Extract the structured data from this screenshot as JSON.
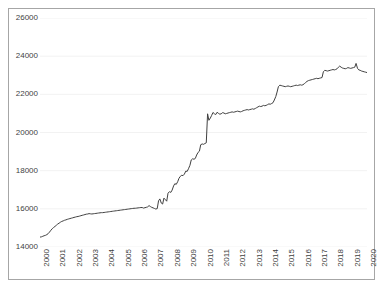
{
  "title_remnant": "",
  "chart_data": {
    "type": "line",
    "title": "",
    "subtitle": "",
    "xlabel": "",
    "ylabel": "",
    "xlim": [
      2000,
      2020
    ],
    "ylim": [
      14000,
      26000
    ],
    "y_ticks": [
      14000,
      16000,
      18000,
      20000,
      22000,
      24000,
      26000
    ],
    "y_tick_labels": [
      "14000",
      "16000",
      "18000",
      "20000",
      "22000",
      "24000",
      "26000"
    ],
    "x_ticks": [
      2000,
      2001,
      2002,
      2003,
      2004,
      2005,
      2006,
      2007,
      2008,
      2009,
      2010,
      2011,
      2012,
      2013,
      2014,
      2015,
      2016,
      2017,
      2018,
      2019,
      2020
    ],
    "x_tick_labels": [
      "2000",
      "2001",
      "2002",
      "2003",
      "2004",
      "2005",
      "2006",
      "2007",
      "2008",
      "2009",
      "2010",
      "2011",
      "2012",
      "2013",
      "2014",
      "2015",
      "2016",
      "2017",
      "2018",
      "2019",
      "2020"
    ],
    "x_tick_rotation": -90,
    "grid": {
      "horizontal": true,
      "vertical": false,
      "color": "#f2f2f2"
    },
    "legend": {
      "visible": false,
      "position": "none"
    },
    "line_color": "#404040",
    "line_width": 1,
    "marker": "none",
    "series": [
      {
        "name": "series-1",
        "x": [
          2000.0,
          2000.08,
          2000.17,
          2000.25,
          2000.33,
          2000.42,
          2000.5,
          2000.58,
          2000.67,
          2000.75,
          2000.83,
          2000.92,
          2001.0,
          2001.08,
          2001.17,
          2001.25,
          2001.33,
          2001.42,
          2001.5,
          2001.58,
          2001.67,
          2001.75,
          2001.83,
          2001.92,
          2002.0,
          2002.08,
          2002.17,
          2002.25,
          2002.33,
          2002.42,
          2002.5,
          2002.58,
          2002.67,
          2002.75,
          2002.83,
          2002.92,
          2003.0,
          2003.08,
          2003.17,
          2003.25,
          2003.33,
          2003.42,
          2003.5,
          2003.58,
          2003.67,
          2003.75,
          2003.83,
          2003.92,
          2004.0,
          2004.08,
          2004.17,
          2004.25,
          2004.33,
          2004.42,
          2004.5,
          2004.58,
          2004.67,
          2004.75,
          2004.83,
          2004.92,
          2005.0,
          2005.08,
          2005.17,
          2005.25,
          2005.33,
          2005.42,
          2005.5,
          2005.58,
          2005.67,
          2005.75,
          2005.83,
          2005.92,
          2006.0,
          2006.08,
          2006.17,
          2006.25,
          2006.33,
          2006.42,
          2006.5,
          2006.58,
          2006.67,
          2006.75,
          2006.83,
          2006.92,
          2007.0,
          2007.08,
          2007.17,
          2007.25,
          2007.33,
          2007.42,
          2007.5,
          2007.58,
          2007.67,
          2007.75,
          2007.83,
          2007.92,
          2008.0,
          2008.08,
          2008.17,
          2008.25,
          2008.33,
          2008.42,
          2008.5,
          2008.58,
          2008.67,
          2008.75,
          2008.83,
          2008.92,
          2009.0,
          2009.08,
          2009.17,
          2009.25,
          2009.33,
          2009.42,
          2009.5,
          2009.58,
          2009.67,
          2009.75,
          2009.83,
          2009.92,
          2010.0,
          2010.08,
          2010.17,
          2010.25,
          2010.33,
          2010.42,
          2010.5,
          2010.58,
          2010.67,
          2010.75,
          2010.83,
          2010.92,
          2011.0,
          2011.08,
          2011.17,
          2011.25,
          2011.33,
          2011.42,
          2011.5,
          2011.58,
          2011.67,
          2011.75,
          2011.83,
          2011.92,
          2012.0,
          2012.08,
          2012.17,
          2012.25,
          2012.33,
          2012.42,
          2012.5,
          2012.58,
          2012.67,
          2012.75,
          2012.83,
          2012.92,
          2013.0,
          2013.08,
          2013.17,
          2013.25,
          2013.33,
          2013.42,
          2013.5,
          2013.58,
          2013.67,
          2013.75,
          2013.83,
          2013.92,
          2014.0,
          2014.08,
          2014.17,
          2014.25,
          2014.33,
          2014.42,
          2014.5,
          2014.58,
          2014.67,
          2014.75,
          2014.83,
          2014.92,
          2015.0,
          2015.08,
          2015.17,
          2015.25,
          2015.33,
          2015.42,
          2015.5,
          2015.58,
          2015.67,
          2015.75,
          2015.83,
          2015.92,
          2016.0,
          2016.08,
          2016.17,
          2016.25,
          2016.33,
          2016.42,
          2016.5,
          2016.58,
          2016.67,
          2016.75,
          2016.83,
          2016.92,
          2017.0,
          2017.08,
          2017.17,
          2017.25,
          2017.33,
          2017.42,
          2017.5,
          2017.58,
          2017.67,
          2017.75,
          2017.83,
          2017.92,
          2018.0,
          2018.08,
          2018.17,
          2018.25,
          2018.33,
          2018.42,
          2018.5,
          2018.58,
          2018.67,
          2018.75,
          2018.83,
          2018.92,
          2019.0,
          2019.08,
          2019.17,
          2019.25,
          2019.33,
          2019.42,
          2019.5,
          2019.58,
          2019.67,
          2019.75,
          2019.83,
          2019.92,
          2020.0
        ],
        "values": [
          14520,
          14530,
          14560,
          14590,
          14610,
          14650,
          14700,
          14780,
          14880,
          14960,
          15020,
          15080,
          15140,
          15200,
          15250,
          15300,
          15340,
          15370,
          15400,
          15420,
          15450,
          15470,
          15490,
          15510,
          15530,
          15550,
          15570,
          15590,
          15600,
          15620,
          15640,
          15660,
          15680,
          15700,
          15720,
          15730,
          15750,
          15740,
          15730,
          15740,
          15750,
          15760,
          15770,
          15780,
          15790,
          15800,
          15800,
          15810,
          15820,
          15830,
          15840,
          15850,
          15860,
          15870,
          15880,
          15890,
          15900,
          15910,
          15920,
          15930,
          15940,
          15950,
          15960,
          15970,
          15980,
          15990,
          16000,
          16010,
          16020,
          16030,
          16030,
          16040,
          16050,
          16060,
          16070,
          16070,
          16040,
          16060,
          16080,
          16100,
          16170,
          16120,
          16080,
          16050,
          16020,
          15990,
          16010,
          16420,
          16520,
          16300,
          16250,
          16560,
          16480,
          16400,
          16820,
          16900,
          16860,
          16980,
          17200,
          17320,
          17280,
          17420,
          17600,
          17700,
          17760,
          17740,
          17820,
          17980,
          17960,
          18100,
          18280,
          18560,
          18620,
          18600,
          18640,
          18820,
          18960,
          19020,
          19360,
          19400,
          19380,
          19420,
          19460,
          20980,
          20640,
          20760,
          20900,
          21050,
          20980,
          20940,
          21060,
          21000,
          20960,
          20980,
          21040,
          21020,
          20980,
          21000,
          21020,
          21040,
          21060,
          21080,
          21060,
          21080,
          21100,
          21120,
          21100,
          21080,
          21100,
          21140,
          21160,
          21180,
          21200,
          21180,
          21200,
          21220,
          21240,
          21220,
          21260,
          21300,
          21340,
          21380,
          21360,
          21380,
          21420,
          21400,
          21420,
          21460,
          21500,
          21480,
          21520,
          21560,
          21700,
          21880,
          22120,
          22400,
          22480,
          22460,
          22440,
          22420,
          22400,
          22420,
          22440,
          22420,
          22400,
          22420,
          22440,
          22460,
          22480,
          22460,
          22480,
          22500,
          22480,
          22500,
          22560,
          22620,
          22680,
          22720,
          22740,
          22760,
          22780,
          22800,
          22820,
          22840,
          22820,
          22840,
          22860,
          22880,
          23180,
          23260,
          23240,
          23220,
          23240,
          23260,
          23280,
          23300,
          23280,
          23300,
          23340,
          23420,
          23480,
          23420,
          23380,
          23360,
          23340,
          23360,
          23400,
          23380,
          23360,
          23380,
          23400,
          23420,
          23620,
          23360,
          23280,
          23260,
          23220,
          23200,
          23180,
          23160,
          23140
        ]
      }
    ]
  },
  "axes": {
    "y_label_color": "#3f3f3f",
    "x_label_color": "#3f3f3f",
    "frame_color": "#a6a6a6"
  }
}
